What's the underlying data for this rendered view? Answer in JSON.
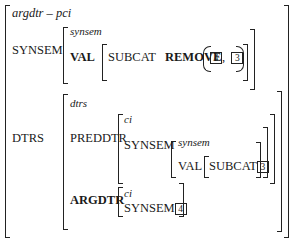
{
  "avm": {
    "type": "argdtr – pci",
    "synsem": {
      "feature": "SYNSEM",
      "type": "synsem",
      "val_feature": "VAL",
      "subcat_feature": "SUBCAT",
      "function": "REMOVE",
      "args": [
        "4",
        "3"
      ],
      "separator": ","
    },
    "dtrs": {
      "feature": "DTRS",
      "type": "dtrs",
      "preddtr": {
        "feature": "PREDDTR",
        "type": "ci",
        "synsem_feature": "SYNSEM",
        "synsem_type": "synsem",
        "val_feature": "VAL",
        "subcat_feature": "SUBCAT",
        "subcat_tag": "3"
      },
      "argdtr": {
        "feature": "ARGDTR",
        "type": "ci",
        "synsem_feature": "SYNSEM",
        "synsem_tag": "4"
      }
    }
  }
}
